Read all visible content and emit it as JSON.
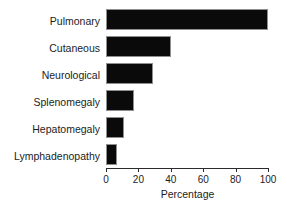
{
  "chart_data": {
    "type": "bar",
    "orientation": "horizontal",
    "title": "",
    "subtitle": "",
    "xlabel": "Percentage",
    "ylabel": "",
    "categories": [
      "Pulmonary",
      "Cutaneous",
      "Neurological",
      "Splenomegaly",
      "Hepatomegaly",
      "Lymphadenopathy"
    ],
    "values": [
      100,
      40,
      29,
      17,
      11,
      7
    ],
    "xlim": [
      0,
      100
    ],
    "xticks": [
      0,
      20,
      40,
      60,
      80,
      100
    ],
    "xtick_labels": [
      "0",
      "20",
      "40",
      "60",
      "80",
      "100"
    ],
    "grid": false,
    "legend": false,
    "legend_position": "none",
    "bar_color": "#0a0a0a",
    "bar_edge_color": "#8f8f8f",
    "axis_color": "#2b2b2b",
    "background_color": "#ffffff",
    "annotations": []
  }
}
